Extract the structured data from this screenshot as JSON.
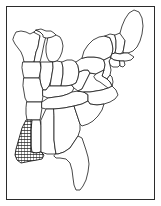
{
  "figure": {
    "background_color": "#ffffff",
    "line_color": "#1a1a1a",
    "frame_color": "#2b2b2b",
    "highlight_fill": "hatch-crosshatch",
    "caption": ""
  },
  "frame": {
    "inset_px": 6,
    "width_px": 149,
    "height_px": 194,
    "border_width_px": 1
  },
  "map": {
    "region": "Eastern United States",
    "projection_style": "simplified outline",
    "highlighted_states": [
      "Louisiana"
    ],
    "states": [
      {
        "id": "MN",
        "name": "Minnesota"
      },
      {
        "id": "WI",
        "name": "Wisconsin"
      },
      {
        "id": "MI",
        "name": "Michigan"
      },
      {
        "id": "IA",
        "name": "Iowa"
      },
      {
        "id": "IL",
        "name": "Illinois"
      },
      {
        "id": "IN",
        "name": "Indiana"
      },
      {
        "id": "OH",
        "name": "Ohio"
      },
      {
        "id": "MO",
        "name": "Missouri"
      },
      {
        "id": "KY",
        "name": "Kentucky"
      },
      {
        "id": "WV",
        "name": "West Virginia"
      },
      {
        "id": "PA",
        "name": "Pennsylvania"
      },
      {
        "id": "NY",
        "name": "New York"
      },
      {
        "id": "VT",
        "name": "Vermont"
      },
      {
        "id": "NH",
        "name": "New Hampshire"
      },
      {
        "id": "ME",
        "name": "Maine"
      },
      {
        "id": "MA",
        "name": "Massachusetts"
      },
      {
        "id": "CT",
        "name": "Connecticut"
      },
      {
        "id": "RI",
        "name": "Rhode Island"
      },
      {
        "id": "NJ",
        "name": "New Jersey"
      },
      {
        "id": "DE",
        "name": "Delaware"
      },
      {
        "id": "MD",
        "name": "Maryland"
      },
      {
        "id": "VA",
        "name": "Virginia"
      },
      {
        "id": "NC",
        "name": "North Carolina"
      },
      {
        "id": "SC",
        "name": "South Carolina"
      },
      {
        "id": "GA",
        "name": "Georgia"
      },
      {
        "id": "FL",
        "name": "Florida"
      },
      {
        "id": "AL",
        "name": "Alabama"
      },
      {
        "id": "MS",
        "name": "Mississippi"
      },
      {
        "id": "TN",
        "name": "Tennessee"
      },
      {
        "id": "AR",
        "name": "Arkansas"
      },
      {
        "id": "LA",
        "name": "Louisiana"
      }
    ]
  }
}
